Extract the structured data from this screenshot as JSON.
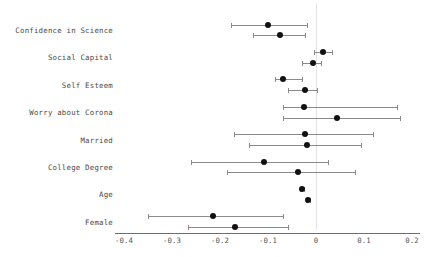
{
  "chart_data": {
    "type": "scatter",
    "title": "",
    "subtitle": "",
    "xlabel": "",
    "ylabel": "",
    "xlim": [
      -0.4,
      0.2
    ],
    "xticks": [
      -0.4,
      -0.3,
      -0.2,
      -0.1,
      0,
      0.1,
      0.2
    ],
    "xticklabels": [
      "-0.4",
      "-0.3",
      "-0.2",
      "-0.1",
      "0",
      "0.1",
      "0.2"
    ],
    "grid": false,
    "legend": "none",
    "reference_line": 0,
    "categories": [
      "Confidence in Science",
      "Social Capital",
      "Self Esteem",
      "Worry about Corona",
      "Married",
      "College Degree",
      "Age",
      "Female"
    ],
    "series": [
      {
        "name": "Model 1",
        "offset": -0.18,
        "points": [
          {
            "category": "Confidence in Science",
            "estimate": -0.101,
            "ci_low": -0.177,
            "ci_high": -0.019
          },
          {
            "category": "Social Capital",
            "estimate": 0.015,
            "ci_low": -0.004,
            "ci_high": 0.034
          },
          {
            "category": "Self Esteem",
            "estimate": -0.069,
            "ci_low": -0.086,
            "ci_high": -0.03
          },
          {
            "category": "Worry about Corona",
            "estimate": -0.025,
            "ci_low": -0.069,
            "ci_high": 0.169
          },
          {
            "category": "Married",
            "estimate": -0.023,
            "ci_low": -0.17,
            "ci_high": 0.119
          },
          {
            "category": "College Degree",
            "estimate": -0.109,
            "ci_low": -0.26,
            "ci_high": 0.026
          },
          {
            "category": "Age",
            "estimate": -0.029,
            "ci_low": -0.033,
            "ci_high": -0.025
          },
          {
            "category": "Female",
            "estimate": -0.215,
            "ci_low": -0.35,
            "ci_high": -0.069
          }
        ]
      },
      {
        "name": "Model 2",
        "offset": 0.18,
        "points": [
          {
            "category": "Confidence in Science",
            "estimate": -0.076,
            "ci_low": -0.132,
            "ci_high": -0.023
          },
          {
            "category": "Social Capital",
            "estimate": -0.007,
            "ci_low": -0.029,
            "ci_high": 0.01
          },
          {
            "category": "Self Esteem",
            "estimate": -0.023,
            "ci_low": -0.059,
            "ci_high": 0.002
          },
          {
            "category": "Worry about Corona",
            "estimate": 0.044,
            "ci_low": -0.069,
            "ci_high": 0.176
          },
          {
            "category": "Married",
            "estimate": -0.019,
            "ci_low": -0.14,
            "ci_high": 0.094
          },
          {
            "category": "College Degree",
            "estimate": -0.038,
            "ci_low": -0.185,
            "ci_high": 0.082
          },
          {
            "category": "Age",
            "estimate": -0.017,
            "ci_low": -0.021,
            "ci_high": -0.013
          },
          {
            "category": "Female",
            "estimate": -0.169,
            "ci_low": -0.267,
            "ci_high": -0.059
          }
        ]
      }
    ]
  },
  "colors": {
    "dot": "#111111",
    "interval": "#8a8a8a",
    "axis": "#6e6e6e",
    "reference_line": "#e2e2e6",
    "label_text": "#4a4a4a",
    "tick_text": "#555555",
    "background": "#ffffff"
  }
}
